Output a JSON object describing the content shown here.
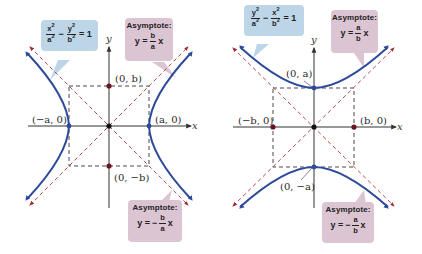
{
  "figure": {
    "colors": {
      "curve": "#2e4a9a",
      "asymptote": "#b23a3a",
      "box": "#333333",
      "axis": "#333333",
      "point": "#6b1422",
      "callout_equation_bg": "#bcd6e8",
      "callout_asymptote_bg": "#dcc5d2"
    }
  },
  "left_graph": {
    "axis_x": "x",
    "axis_y": "y",
    "equation": {
      "term1_num": "x",
      "term1_den": "a",
      "term2_num": "y",
      "term2_den": "b",
      "exp": "2",
      "minus": "−",
      "equals": "= 1"
    },
    "asymptote_upper": {
      "title": "Asymptote:",
      "lhs": "y =",
      "sign": "",
      "num": "b",
      "den": "a",
      "var": "x"
    },
    "asymptote_lower": {
      "title": "Asymptote:",
      "lhs": "y =",
      "sign": "−",
      "num": "b",
      "den": "a",
      "var": "x"
    },
    "points": {
      "top": "(0, b)",
      "bottom": "(0, −b)",
      "left": "(−a, 0)",
      "right": "(a, 0)"
    }
  },
  "right_graph": {
    "axis_x": "x",
    "axis_y": "y",
    "equation": {
      "term1_num": "y",
      "term1_den": "a",
      "term2_num": "x",
      "term2_den": "b",
      "exp": "2",
      "minus": "−",
      "equals": "= 1"
    },
    "asymptote_upper": {
      "title": "Asymptote:",
      "lhs": "y =",
      "sign": "",
      "num": "a",
      "den": "b",
      "var": "x"
    },
    "asymptote_lower": {
      "title": "Asymptote:",
      "lhs": "y =",
      "sign": "−",
      "num": "a",
      "den": "b",
      "var": "x"
    },
    "points": {
      "top": "(0, a)",
      "bottom": "(0, −a)",
      "left": "(−b, 0)",
      "right": "(b, 0)"
    }
  }
}
